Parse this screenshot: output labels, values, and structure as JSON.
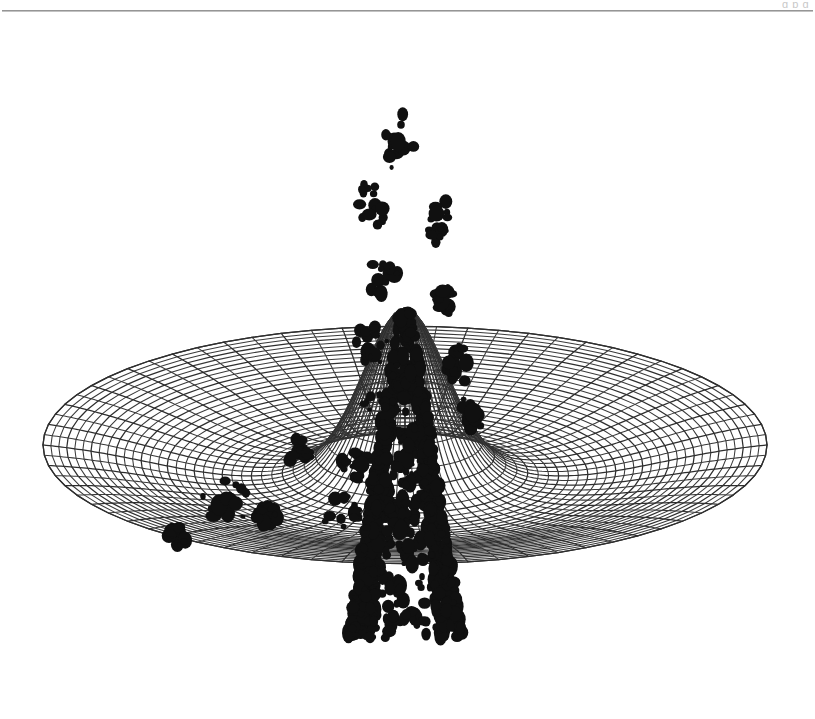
{
  "page": {
    "background_color": "#ffffff",
    "width": 815,
    "height": 719,
    "header_remnant_text": "g  p                                                     g",
    "rule_color": "#8d8d8d",
    "caption": ""
  },
  "figure": {
    "title": "",
    "render_style": "wireframe-mesh",
    "line_color": "#2e2e2e",
    "blob_color": "#101010",
    "background_color": "#ffffff",
    "artifact_note": "scanned page with heavy ink blotch artifacts over the mesh"
  },
  "chart_data": {
    "type": "line",
    "plot_kind": "3d-wireframe-surface",
    "title": "",
    "subtitle": "",
    "xlabel": "",
    "ylabel": "",
    "zlabel": "",
    "legend": [],
    "grid": true,
    "legend_position": "none",
    "surface": {
      "function": "mexican-hat / sombrero: z = A * exp(-r^2 / (2*s^2)) - B * exp(-r^2 / (2*t^2))",
      "coordinate_system": "polar",
      "domain_radius": 1.0,
      "radial_divisions": 36,
      "angular_divisions": 72,
      "amplitude_peak": 1.0,
      "trough_depth": -0.22,
      "trough_radius": 0.42,
      "peak_sigma": 0.115,
      "trough_sigma": 0.38,
      "rim_height": 0.02
    },
    "projection": {
      "type": "orthographic",
      "azimuth_deg": 0,
      "elevation_deg": 22,
      "center_x": 405,
      "center_y": 430,
      "scale_x": 362,
      "scale_y": 128,
      "z_scale": 392
    },
    "axis_ranges": {
      "x": [
        -1,
        1
      ],
      "y": [
        -1,
        1
      ],
      "z": [
        -0.25,
        1.0
      ]
    },
    "annotations": [],
    "tick_labels": {
      "x": [],
      "y": [],
      "z": []
    },
    "ink_blobs": [
      {
        "cx": 398,
        "cy": 128,
        "rx": 16,
        "ry": 30,
        "seed": 11
      },
      {
        "cx": 372,
        "cy": 190,
        "rx": 14,
        "ry": 26,
        "seed": 23
      },
      {
        "cx": 438,
        "cy": 205,
        "rx": 12,
        "ry": 24,
        "seed": 37
      },
      {
        "cx": 383,
        "cy": 262,
        "rx": 15,
        "ry": 22,
        "seed": 41
      },
      {
        "cx": 443,
        "cy": 288,
        "rx": 11,
        "ry": 20,
        "seed": 53
      },
      {
        "cx": 370,
        "cy": 330,
        "rx": 17,
        "ry": 24,
        "seed": 67
      },
      {
        "cx": 458,
        "cy": 350,
        "rx": 14,
        "ry": 22,
        "seed": 71
      },
      {
        "cx": 381,
        "cy": 396,
        "rx": 18,
        "ry": 20,
        "seed": 83
      },
      {
        "cx": 470,
        "cy": 400,
        "rx": 14,
        "ry": 19,
        "seed": 97
      },
      {
        "cx": 410,
        "cy": 442,
        "rx": 20,
        "ry": 18,
        "seed": 101
      },
      {
        "cx": 356,
        "cy": 452,
        "rx": 16,
        "ry": 17,
        "seed": 103
      },
      {
        "cx": 300,
        "cy": 437,
        "rx": 15,
        "ry": 15,
        "seed": 107
      },
      {
        "cx": 222,
        "cy": 490,
        "rx": 30,
        "ry": 26,
        "seed": 109
      },
      {
        "cx": 268,
        "cy": 500,
        "rx": 14,
        "ry": 13,
        "seed": 113
      },
      {
        "cx": 340,
        "cy": 498,
        "rx": 22,
        "ry": 17,
        "seed": 127
      },
      {
        "cx": 392,
        "cy": 497,
        "rx": 24,
        "ry": 16,
        "seed": 131
      },
      {
        "cx": 430,
        "cy": 487,
        "rx": 14,
        "ry": 13,
        "seed": 137
      },
      {
        "cx": 177,
        "cy": 520,
        "rx": 12,
        "ry": 12,
        "seed": 139
      }
    ]
  }
}
